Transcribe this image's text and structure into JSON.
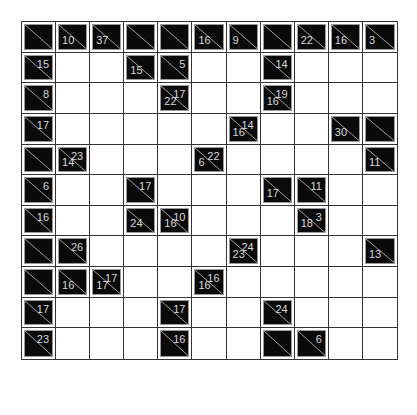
{
  "puzzle": {
    "type": "kakuro",
    "rows": 11,
    "cols": 11,
    "legend": {
      "B": "blank black cell",
      "W": "white entry cell",
      "r": "across (right) clue sum",
      "d": "down clue sum"
    },
    "grid": [
      [
        "B",
        {
          "d": "10"
        },
        {
          "d": "37"
        },
        "B",
        "B",
        {
          "d": "16"
        },
        {
          "d": "9"
        },
        "B",
        {
          "d": "22"
        },
        {
          "d": "16"
        },
        {
          "d": "3"
        }
      ],
      [
        {
          "r": "15"
        },
        "W",
        "W",
        {
          "d": "15"
        },
        {
          "r": "5"
        },
        "W",
        "W",
        {
          "r": "14"
        },
        "W",
        "W",
        "W"
      ],
      [
        {
          "r": "8"
        },
        "W",
        "W",
        "W",
        {
          "r": "17",
          "d": "22"
        },
        "W",
        "W",
        {
          "r": "19",
          "d": "16"
        },
        "W",
        "W",
        "W"
      ],
      [
        {
          "r": "17"
        },
        "W",
        "W",
        "W",
        "W",
        "W",
        {
          "r": "14",
          "d": "16"
        },
        "W",
        "W",
        {
          "d": "30"
        },
        "B"
      ],
      [
        "B",
        {
          "r": "23",
          "d": "14"
        },
        "W",
        "W",
        "W",
        {
          "r": "22",
          "d": "6"
        },
        "W",
        "W",
        "W",
        "W",
        {
          "d": "11"
        }
      ],
      [
        {
          "r": "6"
        },
        "W",
        "W",
        {
          "r": "17"
        },
        "W",
        "W",
        "W",
        {
          "d": "17"
        },
        {
          "r": "11"
        },
        "W",
        "W"
      ],
      [
        {
          "r": "16"
        },
        "W",
        "W",
        {
          "d": "24"
        },
        {
          "r": "10",
          "d": "16"
        },
        "W",
        "W",
        "W",
        {
          "r": "3",
          "d": "18"
        },
        "W",
        "W"
      ],
      [
        "B",
        {
          "r": "26"
        },
        "W",
        "W",
        "W",
        "W",
        {
          "r": "24",
          "d": "23"
        },
        "W",
        "W",
        "W",
        {
          "d": "13"
        }
      ],
      [
        "B",
        {
          "d": "16"
        },
        {
          "r": "17",
          "d": "17"
        },
        "W",
        "W",
        {
          "r": "16",
          "d": "16"
        },
        "W",
        "W",
        "W",
        "W",
        "W"
      ],
      [
        {
          "r": "17"
        },
        "W",
        "W",
        "W",
        {
          "r": "17"
        },
        "W",
        "W",
        {
          "r": "24"
        },
        "W",
        "W",
        "W"
      ],
      [
        {
          "r": "23"
        },
        "W",
        "W",
        "W",
        {
          "r": "16"
        },
        "W",
        "W",
        "B",
        {
          "r": "6"
        },
        "W",
        "W"
      ]
    ]
  },
  "colors": {
    "clue_background": "#0a0a0a",
    "clue_text": "#d8d8d8",
    "grid_lines": "#333333",
    "white_cell": "#ffffff"
  }
}
